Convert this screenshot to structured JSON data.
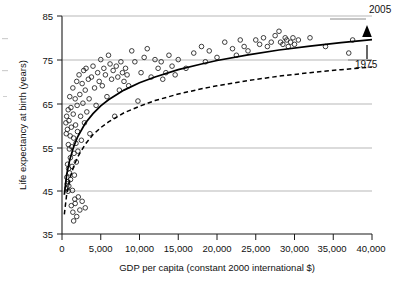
{
  "chart_data": {
    "type": "scatter",
    "title": "",
    "xlabel": "GDP per capita (constant 2000 international $)",
    "ylabel": "Life expectancy at birth (years)",
    "xlim": [
      0,
      40000
    ],
    "ylim": [
      35,
      85
    ],
    "xticks": [
      0,
      5000,
      10000,
      15000,
      20000,
      25000,
      30000,
      35000,
      40000
    ],
    "xtick_labels": [
      "0",
      "5,000",
      "10,000",
      "15,000",
      "20,000",
      "25,000",
      "30,000",
      "35,000",
      "40,000"
    ],
    "yticks": [
      35,
      45,
      55,
      65,
      75,
      85
    ],
    "ytick_labels": [
      "35",
      "45",
      "55",
      "65",
      "75",
      "85"
    ],
    "grid": "horizontal gridlines at 45, 55, 65, 75",
    "legend_position": "right-inline-annotations",
    "series": [
      {
        "name": "2005",
        "style": "solid-line",
        "label": "2005",
        "description": "Fitted logarithmic curve for year 2005, upper curve",
        "points": [
          [
            300,
            44.0
          ],
          [
            600,
            48.6
          ],
          [
            1000,
            52.0
          ],
          [
            1500,
            55.0
          ],
          [
            2000,
            57.2
          ],
          [
            3000,
            60.4
          ],
          [
            4000,
            62.6
          ],
          [
            5000,
            64.4
          ],
          [
            6000,
            65.8
          ],
          [
            8000,
            68.0
          ],
          [
            10000,
            69.7
          ],
          [
            12000,
            71.0
          ],
          [
            15000,
            72.7
          ],
          [
            18000,
            74.0
          ],
          [
            20000,
            74.8
          ],
          [
            24000,
            76.1
          ],
          [
            28000,
            77.2
          ],
          [
            32000,
            78.1
          ],
          [
            36000,
            78.9
          ],
          [
            40000,
            79.6
          ]
        ]
      },
      {
        "name": "1975",
        "style": "dashed-line",
        "label": "1975",
        "description": "Fitted logarithmic curve for year 1975, lower curve",
        "points": [
          [
            300,
            39.5
          ],
          [
            600,
            44.0
          ],
          [
            1000,
            47.6
          ],
          [
            1500,
            50.5
          ],
          [
            2000,
            52.6
          ],
          [
            3000,
            55.6
          ],
          [
            4000,
            57.8
          ],
          [
            5000,
            59.4
          ],
          [
            6000,
            60.7
          ],
          [
            8000,
            62.8
          ],
          [
            10000,
            64.3
          ],
          [
            12000,
            65.6
          ],
          [
            15000,
            67.1
          ],
          [
            18000,
            68.3
          ],
          [
            20000,
            69.0
          ],
          [
            24000,
            70.2
          ],
          [
            28000,
            71.2
          ],
          [
            32000,
            72.0
          ],
          [
            36000,
            72.7
          ],
          [
            40000,
            73.3
          ]
        ]
      },
      {
        "name": "countries",
        "style": "open-circle-markers",
        "label": "",
        "description": "One open circle per country: GDP per capita vs life expectancy",
        "points": [
          [
            500,
            60.5
          ],
          [
            550,
            58.0
          ],
          [
            600,
            62.0
          ],
          [
            620,
            48.0
          ],
          [
            650,
            45.5
          ],
          [
            680,
            46.5
          ],
          [
            700,
            59.0
          ],
          [
            720,
            51.0
          ],
          [
            750,
            47.0
          ],
          [
            780,
            44.8
          ],
          [
            800,
            63.5
          ],
          [
            820,
            55.5
          ],
          [
            850,
            50.0
          ],
          [
            880,
            46.0
          ],
          [
            900,
            61.0
          ],
          [
            950,
            54.5
          ],
          [
            980,
            49.0
          ],
          [
            1000,
            66.5
          ],
          [
            1050,
            57.5
          ],
          [
            1080,
            52.5
          ],
          [
            1100,
            47.5
          ],
          [
            1150,
            64.0
          ],
          [
            1200,
            59.5
          ],
          [
            1250,
            55.0
          ],
          [
            1300,
            50.5
          ],
          [
            1350,
            45.0
          ],
          [
            1400,
            68.5
          ],
          [
            1450,
            62.5
          ],
          [
            1500,
            57.0
          ],
          [
            1550,
            53.5
          ],
          [
            1600,
            48.5
          ],
          [
            1650,
            43.0
          ],
          [
            1700,
            66.0
          ],
          [
            1750,
            60.0
          ],
          [
            1800,
            55.8
          ],
          [
            1850,
            51.5
          ],
          [
            1900,
            70.0
          ],
          [
            1950,
            64.5
          ],
          [
            2000,
            58.5
          ],
          [
            2050,
            54.0
          ],
          [
            1200,
            41.5
          ],
          [
            1400,
            40.0
          ],
          [
            1500,
            38.0
          ],
          [
            1700,
            42.0
          ],
          [
            1900,
            39.0
          ],
          [
            2100,
            43.5
          ],
          [
            2300,
            40.5
          ],
          [
            2600,
            42.5
          ],
          [
            3000,
            41.0
          ],
          [
            2200,
            71.5
          ],
          [
            2300,
            67.0
          ],
          [
            2400,
            62.0
          ],
          [
            2500,
            56.5
          ],
          [
            2600,
            69.5
          ],
          [
            2700,
            65.0
          ],
          [
            2800,
            72.5
          ],
          [
            2900,
            60.5
          ],
          [
            3000,
            68.0
          ],
          [
            3100,
            73.0
          ],
          [
            3200,
            63.0
          ],
          [
            3400,
            70.5
          ],
          [
            3500,
            66.0
          ],
          [
            3600,
            58.0
          ],
          [
            3800,
            71.0
          ],
          [
            4000,
            73.5
          ],
          [
            4200,
            68.5
          ],
          [
            4400,
            64.5
          ],
          [
            4600,
            72.0
          ],
          [
            4800,
            70.0
          ],
          [
            5000,
            75.0
          ],
          [
            5200,
            69.0
          ],
          [
            5400,
            73.0
          ],
          [
            5600,
            71.5
          ],
          [
            5800,
            66.5
          ],
          [
            6000,
            76.0
          ],
          [
            6200,
            74.0
          ],
          [
            6400,
            70.5
          ],
          [
            6600,
            72.5
          ],
          [
            6800,
            62.0
          ],
          [
            7000,
            73.5
          ],
          [
            7200,
            71.0
          ],
          [
            7400,
            68.0
          ],
          [
            7600,
            74.5
          ],
          [
            7800,
            72.0
          ],
          [
            8000,
            70.0
          ],
          [
            8200,
            73.0
          ],
          [
            8400,
            71.5
          ],
          [
            8600,
            69.0
          ],
          [
            9000,
            77.0
          ],
          [
            9400,
            74.5
          ],
          [
            9800,
            65.5
          ],
          [
            10200,
            72.0
          ],
          [
            10600,
            75.5
          ],
          [
            11000,
            77.5
          ],
          [
            11500,
            71.0
          ],
          [
            12000,
            75.0
          ],
          [
            12400,
            73.0
          ],
          [
            12800,
            74.5
          ],
          [
            13000,
            70.5
          ],
          [
            13400,
            72.0
          ],
          [
            13800,
            76.0
          ],
          [
            14200,
            73.5
          ],
          [
            14600,
            71.5
          ],
          [
            15000,
            75.0
          ],
          [
            16000,
            73.0
          ],
          [
            17000,
            76.5
          ],
          [
            18000,
            78.0
          ],
          [
            18500,
            74.5
          ],
          [
            19000,
            77.0
          ],
          [
            20000,
            75.5
          ],
          [
            21000,
            79.0
          ],
          [
            22000,
            77.5
          ],
          [
            22500,
            76.0
          ],
          [
            23000,
            79.5
          ],
          [
            23500,
            78.0
          ],
          [
            24000,
            77.0
          ],
          [
            25000,
            79.5
          ],
          [
            25500,
            78.5
          ],
          [
            26000,
            80.0
          ],
          [
            26500,
            78.0
          ],
          [
            27000,
            79.0
          ],
          [
            27500,
            80.5
          ],
          [
            28000,
            81.5
          ],
          [
            28200,
            79.0
          ],
          [
            28500,
            78.5
          ],
          [
            28800,
            80.0
          ],
          [
            29000,
            79.5
          ],
          [
            29200,
            78.0
          ],
          [
            29500,
            79.0
          ],
          [
            29800,
            80.0
          ],
          [
            30000,
            78.5
          ],
          [
            30500,
            79.5
          ],
          [
            32000,
            80.0
          ],
          [
            34000,
            78.0
          ],
          [
            37000,
            76.5
          ],
          [
            37500,
            79.5
          ]
        ]
      }
    ],
    "annotations": [
      {
        "text": "2005",
        "attached_to": "solid upper curve",
        "x": 40000,
        "y": 83.5
      },
      {
        "text": "1975",
        "attached_to": "dashed lower curve",
        "x": 40000,
        "y": 74.5
      },
      {
        "text": "",
        "type": "vertical-arrow",
        "description": "arrow from 1975 curve up to 2005 curve at x = 40,000"
      }
    ]
  }
}
